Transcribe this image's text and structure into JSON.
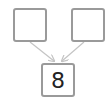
{
  "diagram": {
    "type": "number-bond",
    "parts": [
      {
        "label": "",
        "position": "top-left"
      },
      {
        "label": "",
        "position": "top-right"
      }
    ],
    "whole": {
      "label": "8",
      "position": "bottom-center"
    },
    "colors": {
      "box_border": "#9a9a9a",
      "arrow": "#c4c4c4",
      "text": "#222222",
      "background": "#ffffff"
    }
  }
}
